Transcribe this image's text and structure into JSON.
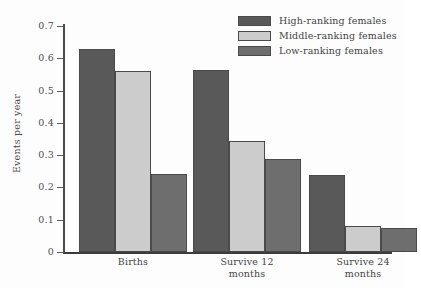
{
  "chart_data": {
    "type": "bar",
    "title": "",
    "xlabel": "",
    "ylabel": "Events per year",
    "ylim": [
      0,
      0.7
    ],
    "yticks": [
      "0",
      "0.1",
      "0.2",
      "0.3",
      "0.4",
      "0.5",
      "0.6",
      "0.7"
    ],
    "ytick_values": [
      0,
      0.1,
      0.2,
      0.3,
      0.4,
      0.5,
      0.6,
      0.7
    ],
    "grid": false,
    "legend_position": "top-right",
    "categories": [
      "Births",
      "Survive 12 months",
      "Survive 24 months"
    ],
    "category_lines": [
      [
        "Births"
      ],
      [
        "Survive 12",
        "months"
      ],
      [
        "Survive 24",
        "months"
      ]
    ],
    "series": [
      {
        "name": "High-ranking females",
        "color": "#595959",
        "values": [
          0.63,
          0.565,
          0.239
        ]
      },
      {
        "name": "Middle-ranking females",
        "color": "#cccccc",
        "values": [
          0.56,
          0.345,
          0.082
        ]
      },
      {
        "name": "Low-ranking females",
        "color": "#6e6e6e",
        "values": [
          0.241,
          0.287,
          0.074
        ]
      }
    ]
  },
  "legend": {
    "items": [
      {
        "label": "High-ranking females",
        "color": "#595959"
      },
      {
        "label": "Middle-ranking females",
        "color": "#cccccc"
      },
      {
        "label": "Low-ranking females",
        "color": "#6e6e6e"
      }
    ]
  },
  "axes": {
    "y_title": "Events per year"
  }
}
